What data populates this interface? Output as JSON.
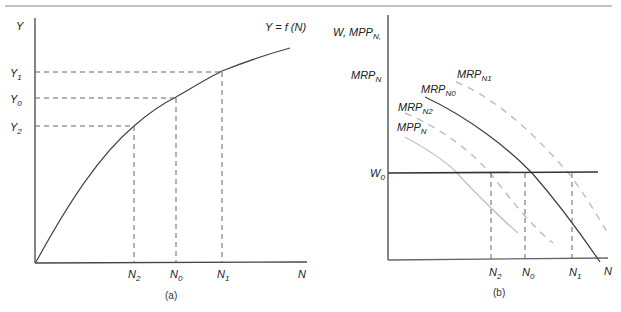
{
  "panel_a": {
    "caption": "(a)",
    "y_axis_label": "Y",
    "x_axis_label": "N",
    "function_label": "Y = f (N)",
    "y_ticks": [
      {
        "base": "Y",
        "sub": "1"
      },
      {
        "base": "Y",
        "sub": "0"
      },
      {
        "base": "Y",
        "sub": "2"
      }
    ],
    "x_ticks": [
      {
        "base": "N",
        "sub": "2"
      },
      {
        "base": "N",
        "sub": "0"
      },
      {
        "base": "N",
        "sub": "1"
      }
    ]
  },
  "panel_b": {
    "caption": "(b)",
    "y_axis_label_line1": {
      "base": "W, MPP",
      "sub": "N,"
    },
    "y_axis_label_line2": {
      "base": "MRP",
      "sub": "N"
    },
    "x_axis_label": "N",
    "wage_label": {
      "base": "W",
      "sub": "0"
    },
    "curves": [
      {
        "base": "MRP",
        "sub": "N1",
        "style": "dashed-light"
      },
      {
        "base": "MRP",
        "sub": "N0",
        "style": "solid-dark"
      },
      {
        "base": "MRP",
        "sub": "N2",
        "style": "dashed-light"
      },
      {
        "base": "MPP",
        "sub": "N",
        "style": "solid-light"
      }
    ],
    "x_ticks": [
      {
        "base": "N",
        "sub": "2"
      },
      {
        "base": "N",
        "sub": "0"
      },
      {
        "base": "N",
        "sub": "1"
      }
    ]
  },
  "colors": {
    "axis": "#444444",
    "dark_curve": "#444444",
    "light_curve": "#b8b8b8",
    "dashed_guide": "#555555"
  }
}
